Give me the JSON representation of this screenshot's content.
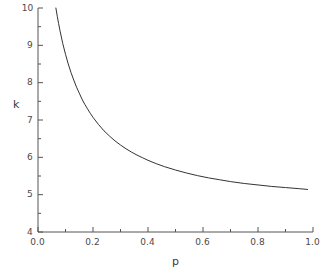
{
  "chart_data": {
    "type": "line",
    "title": "",
    "subtitle": "",
    "xlabel": "p",
    "ylabel": "k",
    "xlim": [
      0.0,
      1.0
    ],
    "ylim": [
      4,
      10
    ],
    "grid": false,
    "legend": null,
    "x_ticks_major": [
      "0.0",
      "0.2",
      "0.4",
      "0.6",
      "0.8",
      "1.0"
    ],
    "x_ticks_major_values": [
      0.0,
      0.2,
      0.4,
      0.6,
      0.8,
      1.0
    ],
    "x_ticks_minor_values": [
      0.1,
      0.3,
      0.5,
      0.7,
      0.9
    ],
    "y_ticks_major": [
      "4",
      "5",
      "6",
      "7",
      "8",
      "9",
      "10"
    ],
    "y_ticks_major_values": [
      4,
      5,
      6,
      7,
      8,
      9,
      10
    ],
    "y_ticks_minor_values": [
      4.5,
      5.5,
      6.5,
      7.5,
      8.5,
      9.5
    ],
    "line_color": "#333333",
    "line_width": 1.0,
    "series": [
      {
        "name": "k(p)",
        "x": [
          0.065,
          0.07,
          0.075,
          0.08,
          0.09,
          0.1,
          0.11,
          0.12,
          0.13,
          0.14,
          0.15,
          0.16,
          0.17,
          0.18,
          0.19,
          0.2,
          0.22,
          0.24,
          0.26,
          0.28,
          0.3,
          0.32,
          0.34,
          0.36,
          0.38,
          0.4,
          0.43,
          0.46,
          0.5,
          0.54,
          0.58,
          0.62,
          0.66,
          0.7,
          0.75,
          0.8,
          0.85,
          0.9,
          0.95,
          0.98
        ],
        "y": [
          10.0,
          9.78,
          9.58,
          9.39,
          9.05,
          8.76,
          8.5,
          8.27,
          8.07,
          7.88,
          7.72,
          7.56,
          7.42,
          7.3,
          7.18,
          7.07,
          6.88,
          6.71,
          6.57,
          6.44,
          6.33,
          6.23,
          6.14,
          6.06,
          5.99,
          5.92,
          5.83,
          5.75,
          5.66,
          5.58,
          5.51,
          5.45,
          5.4,
          5.35,
          5.3,
          5.26,
          5.22,
          5.19,
          5.16,
          5.14
        ]
      }
    ]
  },
  "axes": {
    "x_title": "p",
    "y_title": "k"
  }
}
